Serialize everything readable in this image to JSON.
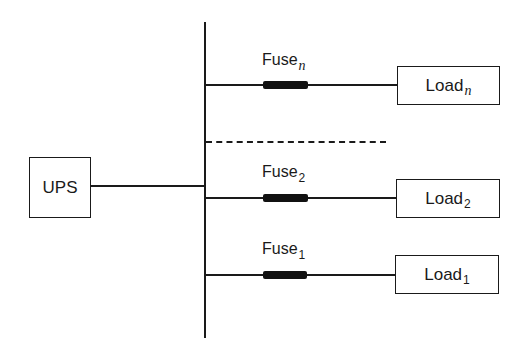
{
  "diagram": {
    "type": "UPS distribution one-line diagram",
    "source": {
      "label": "UPS"
    },
    "bus": {
      "orientation": "vertical"
    },
    "branches": [
      {
        "fuse": {
          "base": "Fuse",
          "sub": "n"
        },
        "load": {
          "base": "Load",
          "sub": "n"
        }
      },
      {
        "fuse": {
          "base": "Fuse",
          "sub": "2"
        },
        "load": {
          "base": "Load",
          "sub": "2"
        }
      },
      {
        "fuse": {
          "base": "Fuse",
          "sub": "1"
        },
        "load": {
          "base": "Load",
          "sub": "1"
        }
      }
    ],
    "ellipsis_branch": {
      "style": "dashed",
      "meaning": "additional branches omitted"
    },
    "colors": {
      "ink": "#1a1a1a",
      "fuse_fill": "#111111",
      "background": "#ffffff"
    }
  }
}
